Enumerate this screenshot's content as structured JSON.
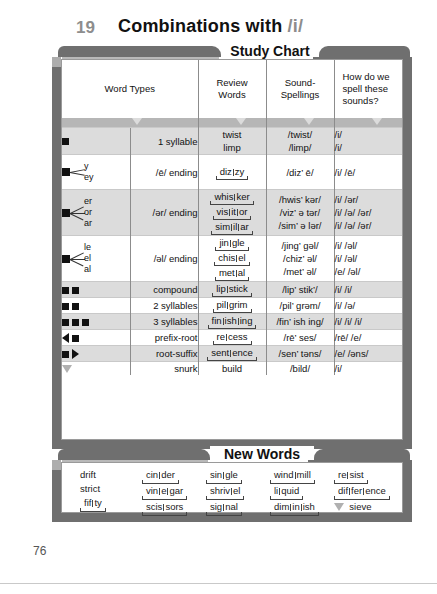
{
  "header": {
    "chapter_number": "19",
    "title_main": "Combinations with",
    "title_phoneme": "/i/",
    "study_chart_label": "Study Chart",
    "new_words_label": "New Words"
  },
  "columns": {
    "word_types": "Word Types",
    "review_words_l1": "Review",
    "review_words_l2": "Words",
    "sound_spellings_l1": "Sound-",
    "sound_spellings_l2": "Spellings",
    "how_spell_l1": "How do we",
    "how_spell_l2": "spell these",
    "how_spell_l3": "sounds?"
  },
  "rows": [
    {
      "symbol": "one-square",
      "branch_labels": [],
      "type": "1 syllable",
      "review": [
        "twist",
        "limp"
      ],
      "review_split": [
        false,
        false
      ],
      "sound": [
        "/twist/",
        "/limp/"
      ],
      "spell": [
        "/i/",
        "/i/"
      ],
      "shaded": true
    },
    {
      "symbol": "fan-2",
      "branch_labels": [
        "y",
        "ey"
      ],
      "type": "/ē/ ending",
      "review": [
        "diz.zy"
      ],
      "review_split": [
        true
      ],
      "sound": [
        "/diz’ ē/"
      ],
      "spell": [
        "/i/  /ē/"
      ],
      "shaded": false
    },
    {
      "symbol": "fan-3",
      "branch_labels": [
        "er",
        "or",
        "ar"
      ],
      "type": "/ər/ ending",
      "review": [
        "whis.ker",
        "vis.it.or",
        "sim.il.ar"
      ],
      "review_split": [
        true,
        true,
        true
      ],
      "sound": [
        "/hwis’ kər/",
        "/viz’ ə tər/",
        "/sim’ ə lər/"
      ],
      "spell": [
        "/i/  /ər/",
        "/i/  /ə/  /ər/",
        "/i/  /ə/  /ər/"
      ],
      "shaded": true
    },
    {
      "symbol": "fan-3",
      "branch_labels": [
        "le",
        "el",
        "al"
      ],
      "type": "/əl/ ending",
      "review": [
        "jin.gle",
        "chis.el",
        "met.al"
      ],
      "review_split": [
        true,
        true,
        true
      ],
      "sound": [
        "/jing’ gəl/",
        "/chiz’ əl/",
        "/met’ əl/"
      ],
      "spell": [
        "/i/  /əl/",
        "/i/  /əl/",
        "/e/  /əl/"
      ],
      "shaded": false
    },
    {
      "symbol": "two-squares",
      "branch_labels": [],
      "type": "compound",
      "review": [
        "lip.stick"
      ],
      "review_split": [
        true
      ],
      "sound": [
        "/lip’ stik’/"
      ],
      "spell": [
        "/i/  /i/"
      ],
      "shaded": true
    },
    {
      "symbol": "two-squares",
      "branch_labels": [],
      "type": "2 syllables",
      "review": [
        "pil.grim"
      ],
      "review_split": [
        true
      ],
      "sound": [
        "/pil’ grəm/"
      ],
      "spell": [
        "/i/  /ə/"
      ],
      "shaded": false
    },
    {
      "symbol": "three-squares",
      "branch_labels": [],
      "type": "3 syllables",
      "review": [
        "fin.ish.ing"
      ],
      "review_split": [
        true
      ],
      "sound": [
        "/fin’ ish ing/"
      ],
      "spell": [
        "/i/  /i/  /i/"
      ],
      "shaded": true
    },
    {
      "symbol": "triangle-left-square",
      "branch_labels": [],
      "type": "prefix-root",
      "review": [
        "re.cess"
      ],
      "review_split": [
        true
      ],
      "sound": [
        "/rē’ ses/"
      ],
      "spell": [
        "/rē/  /e/"
      ],
      "shaded": false
    },
    {
      "symbol": "square-triangle-right",
      "branch_labels": [],
      "type": "root-suffix",
      "review": [
        "sent.ence"
      ],
      "review_split": [
        true
      ],
      "sound": [
        "/sen’ təns/"
      ],
      "spell": [
        "/e/  /əns/"
      ],
      "shaded": true
    },
    {
      "symbol": "triangle-down-open",
      "branch_labels": [],
      "type": "snurk",
      "review": [
        "build"
      ],
      "review_split": [
        false
      ],
      "sound": [
        "/bild/"
      ],
      "spell": [
        "/i/"
      ],
      "shaded": false
    }
  ],
  "new_words": {
    "columns": [
      {
        "words": [
          "drift",
          "strict",
          "fif.ty"
        ],
        "split": [
          false,
          false,
          true
        ],
        "snurk": [
          false,
          false,
          false
        ]
      },
      {
        "words": [
          "cin.der",
          "vin.e.gar",
          "scis.sors"
        ],
        "split": [
          true,
          true,
          true
        ],
        "snurk": [
          false,
          false,
          false
        ]
      },
      {
        "words": [
          "sin.gle",
          "shriv.el",
          "sig.nal"
        ],
        "split": [
          true,
          true,
          true
        ],
        "snurk": [
          false,
          false,
          false
        ]
      },
      {
        "words": [
          "wind.mill",
          "li.quid",
          "dim.in.ish"
        ],
        "split": [
          true,
          true,
          true
        ],
        "snurk": [
          false,
          false,
          false
        ]
      },
      {
        "words": [
          "re.sist",
          "dif.fer.ence",
          "sieve"
        ],
        "split": [
          true,
          true,
          false
        ],
        "snurk": [
          false,
          false,
          true
        ]
      }
    ]
  },
  "footer": {
    "page_number": "76"
  }
}
